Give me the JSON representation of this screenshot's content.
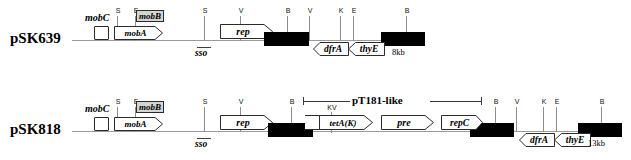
{
  "figure": {
    "rows": [
      {
        "id": "psk639",
        "name": "pSK639",
        "size_label": "8kb",
        "sso_label": "sso",
        "site_ticks": [
          {
            "label": "S"
          },
          {
            "label": "E"
          },
          {
            "label": "S"
          },
          {
            "label": "V"
          },
          {
            "label": "B"
          },
          {
            "label": "V"
          },
          {
            "label": "K"
          },
          {
            "label": "E"
          },
          {
            "label": "B"
          }
        ],
        "genes": [
          {
            "label": "mobC",
            "style": "open-box-unlabeled"
          },
          {
            "label": "mobA",
            "style": "arrow-right"
          },
          {
            "label": "mobB",
            "style": "shaded-box"
          },
          {
            "label": "rep",
            "style": "arrow-right"
          },
          {
            "label": "dfrA",
            "style": "arrow-left"
          },
          {
            "label": "thyE",
            "style": "arrow-left"
          }
        ],
        "black_boxes": 2
      },
      {
        "id": "psk818",
        "name": "pSK818",
        "size_label": "13kb",
        "sso_label": "sso",
        "region_label": "pT181-like",
        "kv_label": "KV",
        "site_ticks": [
          {
            "label": "S"
          },
          {
            "label": "E"
          },
          {
            "label": "S"
          },
          {
            "label": "V"
          },
          {
            "label": "B"
          },
          {
            "label": "B"
          },
          {
            "label": "V"
          },
          {
            "label": "K"
          },
          {
            "label": "E"
          },
          {
            "label": "B"
          }
        ],
        "genes": [
          {
            "label": "mobC",
            "style": "open-box-unlabeled"
          },
          {
            "label": "mobA",
            "style": "arrow-right"
          },
          {
            "label": "mobB",
            "style": "shaded-box"
          },
          {
            "label": "rep",
            "style": "arrow-right"
          },
          {
            "label": "tetA(K)",
            "style": "arrow-right"
          },
          {
            "label": "pre",
            "style": "arrow-right"
          },
          {
            "label": "repC",
            "style": "arrow-right"
          },
          {
            "label": "dfrA",
            "style": "arrow-left"
          },
          {
            "label": "thyE",
            "style": "arrow-left"
          }
        ],
        "black_boxes": 3
      }
    ]
  },
  "colors": {
    "line": "#9a9a9a",
    "black_box": "#000000",
    "shaded_gene": "#d4d4d4",
    "text": "#000000"
  }
}
